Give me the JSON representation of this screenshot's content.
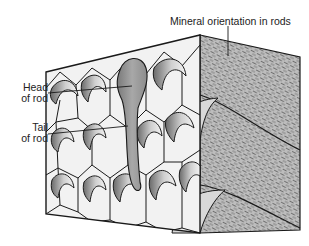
{
  "figure": {
    "labels": {
      "mineral_orientation": "Mineral orientation in rods",
      "head_line1": "Head",
      "head_line2": "of rod",
      "tail_line1": "Tail",
      "tail_line2": "of rod"
    }
  },
  "colors": {
    "background": "#ffffff",
    "outline": "#1a1a1a",
    "cell_fill": "#f2f2f2",
    "rod_shade": "#a0a0a0",
    "highlight_rod": "#8a8a8a",
    "side_face": "#b8b8b8",
    "hatch": "#6e6e6e",
    "text": "#222222"
  }
}
